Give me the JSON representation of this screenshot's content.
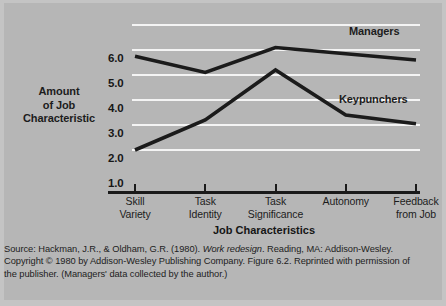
{
  "figure": {
    "y_axis_title_lines": [
      "Amount",
      "of Job",
      "Characteristic"
    ],
    "x_axis_title": "Job Characteristics",
    "source_line1_pre": "Source: Hackman, J.R., & Oldham, G.R. (1980). ",
    "source_line1_italic": "Work redesign",
    "source_line1_post": ". Reading, MA: Addison-Wesley.",
    "source_line2": "Copyright © 1980 by Addison-Wesley Publishing Company. Figure 6.2. Reprinted with permission of",
    "source_line3": "the publisher. (Managers' data collected by the author.)"
  },
  "colors": {
    "background": "#b6b6b6",
    "page": "#c4c4c4",
    "gridline": "#f4f4f4",
    "axis": "#1a1a1a",
    "series": "#1b1b1b",
    "text": "#1c1c1c"
  },
  "chart_data": {
    "type": "line",
    "title": "",
    "xlabel": "Job Characteristics",
    "ylabel": "Amount of Job Characteristic",
    "categories": [
      "Skill Variety",
      "Task Identity",
      "Task Significance",
      "Autonomy",
      "Feedback from Job"
    ],
    "category_label_lines": [
      [
        "Skill",
        "Variety"
      ],
      [
        "Task",
        "Identity"
      ],
      [
        "Task",
        "Significance"
      ],
      [
        "Autonomy",
        ""
      ],
      [
        "Feedback",
        "from Job"
      ]
    ],
    "ylim": [
      1.0,
      7.0
    ],
    "yticks": [
      1.0,
      2.0,
      3.0,
      4.0,
      5.0,
      6.0
    ],
    "ytick_labels": [
      "1.0",
      "2.0",
      "3.0",
      "4.0",
      "5.0",
      "6.0"
    ],
    "gridlines": [
      2.0,
      3.0,
      4.0,
      5.0,
      6.0,
      7.0
    ],
    "grid": true,
    "legend_position": "inline-right",
    "series": [
      {
        "name": "Managers",
        "values": [
          5.75,
          5.1,
          6.1,
          5.85,
          5.6
        ]
      },
      {
        "name": "Keypunchers",
        "values": [
          2.0,
          3.2,
          5.2,
          3.4,
          3.05
        ]
      }
    ]
  }
}
